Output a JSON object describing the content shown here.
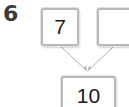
{
  "question": {
    "number": "6"
  },
  "diagram": {
    "part_a": "7",
    "part_b": "",
    "whole": "10"
  },
  "colors": {
    "box_border": "#b8b8b8",
    "arrow": "#b0b0b0",
    "text": "#1a1a1a"
  }
}
